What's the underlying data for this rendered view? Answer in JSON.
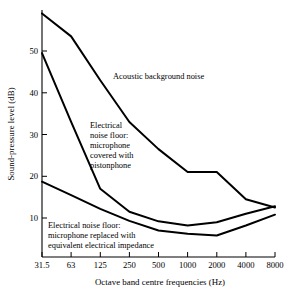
{
  "chart_data": {
    "type": "line",
    "title": "",
    "xlabel": "Octave band centre frequencies (Hz)",
    "ylabel": "Sound-pressure level (dB)",
    "categories": [
      "31.5",
      "63",
      "125",
      "250",
      "500",
      "1000",
      "2000",
      "4000",
      "8000"
    ],
    "x_tick_labels": [
      "31.5",
      "63",
      "125",
      "250",
      "500",
      "1000",
      "2000",
      "4000",
      "8000"
    ],
    "y_tick_labels": [
      "10",
      "20",
      "30",
      "40",
      "50"
    ],
    "y_tick_values": [
      10,
      20,
      30,
      40,
      50
    ],
    "ylim": [
      3,
      60
    ],
    "grid": false,
    "legend": "annotations-inline",
    "series": [
      {
        "name": "Acoustic background noise",
        "values": [
          59.0,
          53.5,
          43.0,
          33.0,
          26.5,
          21.0,
          21.0,
          14.5,
          12.5
        ]
      },
      {
        "name": "Electrical noise floor: microphone covered with pistonphone",
        "values": [
          49.5,
          33.0,
          17.0,
          11.5,
          9.2,
          8.2,
          9.0,
          11.0,
          12.8
        ]
      },
      {
        "name": "Electrical noise floor: microphone replaced with equivalent electrical impedance",
        "values": [
          18.7,
          15.5,
          12.2,
          9.3,
          7.0,
          6.2,
          5.8,
          8.2,
          10.8
        ]
      }
    ],
    "annotations": [
      {
        "id": "acoustic-background-noise",
        "lines": [
          "Acoustic background noise"
        ],
        "x": 113,
        "y": 79
      },
      {
        "id": "electrical-noise-floor-pistonphone",
        "lines": [
          "Electrical",
          "noise floor:",
          "microphone",
          "covered with",
          "pistonphone"
        ],
        "x": 90,
        "y": 128
      },
      {
        "id": "electrical-noise-floor-impedance",
        "lines": [
          "Electrical noise floor:",
          "microphone replaced with",
          "equivalent electrical impedance"
        ],
        "x": 48,
        "y": 228
      }
    ]
  },
  "axes": {
    "x_title": "Octave band centre frequencies (Hz)",
    "y_title": "Sound-pressure level (dB)"
  }
}
